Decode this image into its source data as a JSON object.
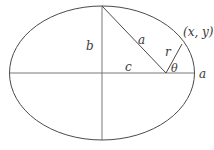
{
  "diagram": {
    "type": "ellipse-geometry",
    "colors": {
      "stroke": "#4a4a4a",
      "text": "#3a3a3a",
      "background": "#ffffff"
    },
    "labels": {
      "semi_major_left": "a",
      "semi_minor": "b",
      "focal_distance": "c",
      "radius": "r",
      "angle": "θ",
      "point": "(x, y)",
      "semi_major_right": "a"
    }
  }
}
